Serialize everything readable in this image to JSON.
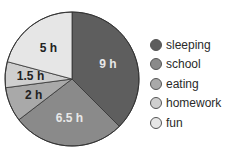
{
  "chart_data": {
    "type": "pie",
    "title": "",
    "unit": "h",
    "categories": [
      "sleeping",
      "school",
      "eating",
      "homework",
      "fun"
    ],
    "values": [
      9,
      6.5,
      2,
      1.5,
      5
    ],
    "labels": [
      "9 h",
      "6.5 h",
      "2 h",
      "1.5 h",
      "5 h"
    ],
    "colors": [
      "#5e5e5e",
      "#8a8a8a",
      "#a9a9a9",
      "#cfcfcf",
      "#e6e6e6"
    ],
    "label_colors": [
      "#e8e8e8",
      "#e8e8e8",
      "#222222",
      "#222222",
      "#222222"
    ],
    "start_angle_deg": 0,
    "direction": "clockwise",
    "legend_position": "right"
  },
  "legend": {
    "items": [
      {
        "label": "sleeping"
      },
      {
        "label": "school"
      },
      {
        "label": "eating"
      },
      {
        "label": "homework"
      },
      {
        "label": "fun"
      }
    ]
  }
}
